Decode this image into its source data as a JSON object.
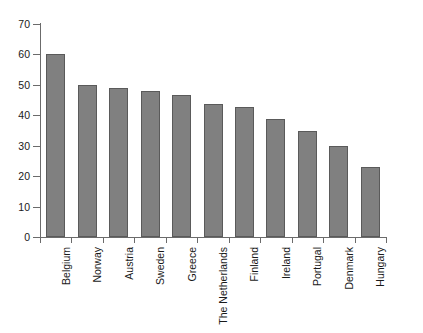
{
  "chart_data": {
    "type": "bar",
    "title": "",
    "subtitle": "",
    "xlabel": "",
    "ylabel": "",
    "ylim": [
      0,
      70
    ],
    "yticks": [
      0,
      10,
      20,
      30,
      40,
      50,
      60,
      70
    ],
    "ytick_labels": [
      "0",
      "10",
      "20",
      "30",
      "40",
      "50",
      "60",
      "70"
    ],
    "grid": false,
    "legend": false,
    "legend_position": "none",
    "bar_color": "#808080",
    "bar_edge_color": "#5a5a5a",
    "axis_color": "#6b6b6b",
    "background": "#ffffff",
    "categories": [
      "Belgium",
      "Norway",
      "Austria",
      "Sweden",
      "Greece",
      "The Netherlands",
      "Finland",
      "Ireland",
      "Portugal",
      "Denmark",
      "Hungary"
    ],
    "values": [
      60,
      50,
      49,
      48,
      46.8,
      43.7,
      42.6,
      38.9,
      35,
      29.8,
      23
    ],
    "annotations": []
  }
}
